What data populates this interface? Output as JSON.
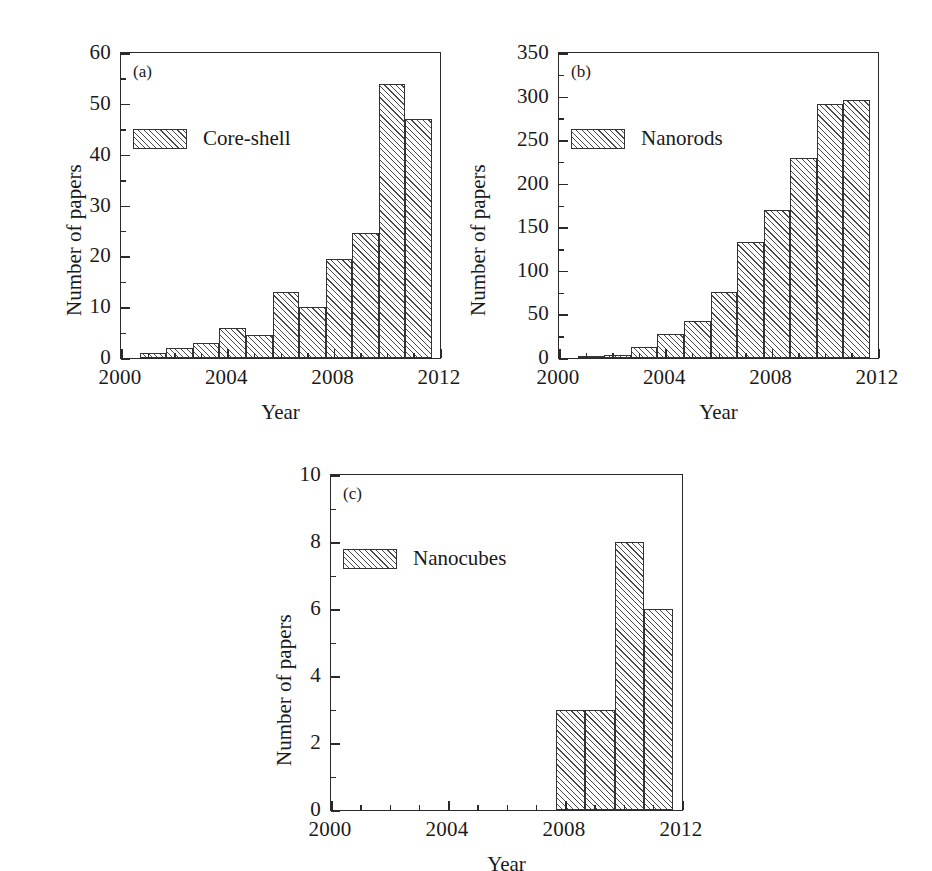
{
  "figure": {
    "panels": [
      {
        "tag": "(a)",
        "legend_label": "Core-shell",
        "xlabel": "Year",
        "ylabel": "Number of papers"
      },
      {
        "tag": "(b)",
        "legend_label": "Nanorods",
        "xlabel": "Year",
        "ylabel": "Number of papers"
      },
      {
        "tag": "(c)",
        "legend_label": "Nanocubes",
        "xlabel": "Year",
        "ylabel": "Number of papers"
      }
    ]
  },
  "chart_data": [
    {
      "type": "bar",
      "title": "(a)",
      "series_name": "Core-shell",
      "xlabel": "Year",
      "ylabel": "Number of papers",
      "categories": [
        2001,
        2002,
        2003,
        2004,
        2005,
        2006,
        2007,
        2008,
        2009,
        2010,
        2011
      ],
      "values": [
        1,
        2,
        3,
        6,
        4.5,
        13,
        10,
        19.5,
        24.5,
        54,
        47
      ],
      "xlim": [
        2000,
        2012
      ],
      "ylim": [
        0,
        60
      ],
      "xticks": [
        2000,
        2004,
        2008,
        2012
      ],
      "xticklabels": [
        "2000",
        "2004",
        "2008",
        "2012"
      ],
      "xtick_minor_step": 1,
      "yticks": [
        0,
        10,
        20,
        30,
        40,
        50,
        60
      ],
      "yticklabels": [
        "0",
        "10",
        "20",
        "30",
        "40",
        "50",
        "60"
      ],
      "ytick_minor_step": 5,
      "grid": false,
      "legend_position": "upper left"
    },
    {
      "type": "bar",
      "title": "(b)",
      "series_name": "Nanorods",
      "xlabel": "Year",
      "ylabel": "Number of papers",
      "categories": [
        2001,
        2002,
        2003,
        2004,
        2005,
        2006,
        2007,
        2008,
        2009,
        2010,
        2011
      ],
      "values": [
        2,
        4,
        13,
        27,
        43,
        76,
        133,
        170,
        230,
        292,
        296
      ],
      "xlim": [
        2000,
        2012
      ],
      "ylim": [
        0,
        350
      ],
      "xticks": [
        2000,
        2004,
        2008,
        2012
      ],
      "xticklabels": [
        "2000",
        "2004",
        "2008",
        "2012"
      ],
      "xtick_minor_step": 1,
      "yticks": [
        0,
        50,
        100,
        150,
        200,
        250,
        300,
        350
      ],
      "yticklabels": [
        "0",
        "50",
        "100",
        "150",
        "200",
        "250",
        "300",
        "350"
      ],
      "ytick_minor_step": 25,
      "grid": false,
      "legend_position": "upper left"
    },
    {
      "type": "bar",
      "title": "(c)",
      "series_name": "Nanocubes",
      "xlabel": "Year",
      "ylabel": "Number of papers",
      "categories": [
        2008,
        2009,
        2010,
        2011
      ],
      "values": [
        3,
        3,
        8,
        6
      ],
      "xlim": [
        2000,
        2012
      ],
      "ylim": [
        0,
        10
      ],
      "xticks": [
        2000,
        2004,
        2008,
        2012
      ],
      "xticklabels": [
        "2000",
        "2004",
        "2008",
        "2012"
      ],
      "xtick_minor_step": 1,
      "yticks": [
        0,
        2,
        4,
        6,
        8,
        10
      ],
      "yticklabels": [
        "0",
        "2",
        "4",
        "6",
        "8",
        "10"
      ],
      "ytick_minor_step": 1,
      "grid": false,
      "legend_position": "upper left"
    }
  ]
}
